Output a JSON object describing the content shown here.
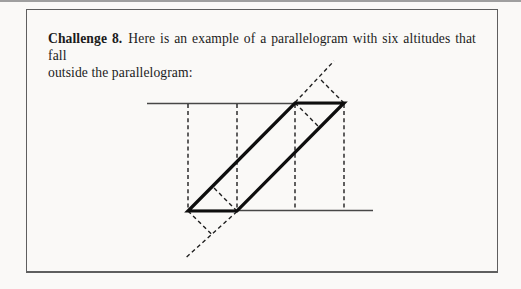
{
  "text": {
    "challenge_label": "Challenge 8.",
    "line1_rest": "Here is an example of a parallelogram with six altitudes that fall",
    "line2": "outside the parallelogram:"
  },
  "colors": {
    "page_background": "#faf9f7",
    "box_border": "#5f5f5f",
    "text": "#1c1c1c",
    "line_thick": "#0e0e0e",
    "line_thin": "#474747",
    "line_dashed": "#1f1f1f",
    "top_edge_line": "#9f9f9f"
  },
  "figure": {
    "parallelogram": {
      "name": "parallelogram-outline",
      "points": [
        [
          188,
          211
        ],
        [
          237,
          211
        ],
        [
          344,
          103
        ],
        [
          295,
          103
        ]
      ]
    },
    "lines": [
      {
        "name": "top-reference-line",
        "style": "thin",
        "x1": 147,
        "y1": 103.5,
        "x2": 344,
        "y2": 103.5
      },
      {
        "name": "bottom-reference-line",
        "style": "thin",
        "x1": 188,
        "y1": 210.5,
        "x2": 373,
        "y2": 210.5
      },
      {
        "name": "vertical-altitude-bottom-left-vertex",
        "style": "dashed",
        "x1": 188,
        "y1": 104,
        "x2": 188,
        "y2": 210
      },
      {
        "name": "vertical-altitude-bottom-right-vertex",
        "style": "dashed",
        "x1": 237,
        "y1": 104,
        "x2": 237,
        "y2": 210
      },
      {
        "name": "vertical-altitude-top-left-vertex",
        "style": "dashed",
        "x1": 295,
        "y1": 104,
        "x2": 295,
        "y2": 210
      },
      {
        "name": "vertical-altitude-top-right-vertex",
        "style": "dashed",
        "x1": 344,
        "y1": 104,
        "x2": 344,
        "y2": 210
      },
      {
        "name": "left-side-extension-above",
        "style": "dashed",
        "x1": 295,
        "y1": 102.5,
        "x2": 334,
        "y2": 61
      },
      {
        "name": "slant-altitude-from-top-right-vertex",
        "style": "dashed",
        "x1": 344,
        "y1": 103,
        "x2": 319.5,
        "y2": 78.5
      },
      {
        "name": "interior-altitude-from-top-left-vertex",
        "style": "dashed",
        "x1": 295,
        "y1": 103,
        "x2": 319.5,
        "y2": 127.5
      },
      {
        "name": "right-side-extension-below",
        "style": "dashed",
        "x1": 237,
        "y1": 211.5,
        "x2": 185,
        "y2": 258.5
      },
      {
        "name": "slant-altitude-from-bottom-left-vertex",
        "style": "dashed",
        "x1": 188,
        "y1": 211,
        "x2": 213,
        "y2": 235.5
      },
      {
        "name": "interior-altitude-from-bottom-right-vertex",
        "style": "dashed",
        "x1": 237,
        "y1": 211,
        "x2": 212,
        "y2": 186
      }
    ]
  }
}
